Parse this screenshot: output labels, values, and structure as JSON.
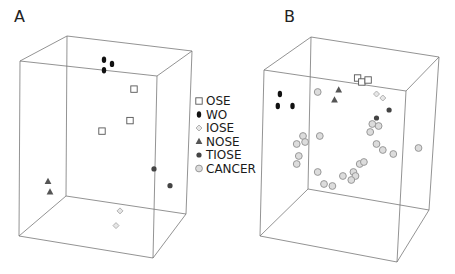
{
  "chart_data": {
    "type": "scatter",
    "subtype": "3d-scatter",
    "legend": {
      "placement": "between-panels",
      "entries": [
        {
          "key": "OSE",
          "label": "OSE",
          "marker": "open-square",
          "color": "#555555"
        },
        {
          "key": "WO",
          "label": "WO",
          "marker": "filled-ellipse",
          "color": "#111111"
        },
        {
          "key": "IOSE",
          "label": "IOSE",
          "marker": "light-diamond",
          "color": "#aaaaaa"
        },
        {
          "key": "NOSE",
          "label": "NOSE",
          "marker": "filled-triangle",
          "color": "#555555"
        },
        {
          "key": "TIOSE",
          "label": "TIOSE",
          "marker": "filled-dot",
          "color": "#444444"
        },
        {
          "key": "CANCER",
          "label": "CANCER",
          "marker": "light-circle",
          "color": "#9a9a9a"
        }
      ]
    },
    "panels": [
      {
        "label": "A",
        "axes_labels": [
          "",
          "",
          ""
        ],
        "note": "projected coordinates: u (0=left,1=right), v (0=top,1=bottom) within panel bounding box",
        "series": [
          {
            "name": "WO",
            "points": [
              [
                0.47,
                0.07
              ],
              [
                0.51,
                0.09
              ],
              [
                0.47,
                0.12
              ]
            ]
          },
          {
            "name": "OSE",
            "points": [
              [
                0.62,
                0.21
              ],
              [
                0.6,
                0.36
              ],
              [
                0.46,
                0.41
              ]
            ]
          },
          {
            "name": "TIOSE",
            "points": [
              [
                0.72,
                0.59
              ],
              [
                0.8,
                0.67
              ]
            ]
          },
          {
            "name": "NOSE",
            "points": [
              [
                0.19,
                0.65
              ],
              [
                0.2,
                0.7
              ]
            ]
          },
          {
            "name": "IOSE",
            "points": [
              [
                0.55,
                0.79
              ],
              [
                0.53,
                0.86
              ]
            ]
          }
        ]
      },
      {
        "label": "B",
        "axes_labels": [
          "",
          "",
          ""
        ],
        "note": "projected coordinates: u (0=left,1=right), v (0=top,1=bottom) within panel bounding box",
        "series": [
          {
            "name": "OSE",
            "points": [
              [
                0.56,
                0.19
              ],
              [
                0.58,
                0.21
              ],
              [
                0.61,
                0.2
              ]
            ]
          },
          {
            "name": "WO",
            "points": [
              [
                0.19,
                0.27
              ],
              [
                0.18,
                0.33
              ],
              [
                0.25,
                0.33
              ]
            ]
          },
          {
            "name": "NOSE",
            "points": [
              [
                0.47,
                0.25
              ],
              [
                0.45,
                0.3
              ]
            ]
          },
          {
            "name": "IOSE",
            "points": [
              [
                0.65,
                0.27
              ],
              [
                0.68,
                0.29
              ]
            ]
          },
          {
            "name": "TIOSE",
            "points": [
              [
                0.71,
                0.35
              ],
              [
                0.65,
                0.39
              ]
            ]
          },
          {
            "name": "CANCER",
            "points": [
              [
                0.37,
                0.26
              ],
              [
                0.63,
                0.42
              ],
              [
                0.66,
                0.43
              ],
              [
                0.62,
                0.46
              ],
              [
                0.65,
                0.52
              ],
              [
                0.68,
                0.55
              ],
              [
                0.73,
                0.57
              ],
              [
                0.85,
                0.54
              ],
              [
                0.3,
                0.48
              ],
              [
                0.38,
                0.48
              ],
              [
                0.27,
                0.52
              ],
              [
                0.31,
                0.51
              ],
              [
                0.28,
                0.58
              ],
              [
                0.27,
                0.62
              ],
              [
                0.37,
                0.66
              ],
              [
                0.57,
                0.62
              ],
              [
                0.59,
                0.61
              ],
              [
                0.54,
                0.66
              ],
              [
                0.49,
                0.68
              ],
              [
                0.55,
                0.68
              ],
              [
                0.53,
                0.7
              ],
              [
                0.4,
                0.72
              ],
              [
                0.44,
                0.73
              ]
            ]
          }
        ]
      }
    ],
    "grid": false
  }
}
